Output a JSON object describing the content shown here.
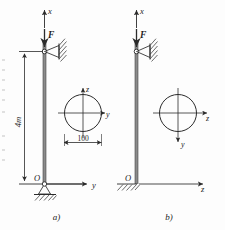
{
  "figure": {
    "title_present": false,
    "panels": [
      {
        "id": "a",
        "caption": "a)",
        "axis_vertical_label": "x",
        "force_label": "F",
        "length_label": "4m",
        "origin_label": "O",
        "axis_horizontal_label": "y",
        "top_support": "pin-support-hatched",
        "bottom_support": "pinned-hinge-ground",
        "section": {
          "shape": "circle",
          "axis_up_label": "z",
          "axis_right_label": "y",
          "dimension_label": "100"
        }
      },
      {
        "id": "b",
        "caption": "b)",
        "axis_vertical_label": "x",
        "force_label": "F",
        "origin_label": "O",
        "axis_horizontal_label": "z",
        "top_support": "pin-support-hatched",
        "bottom_support": "fixed-ground-hatched",
        "section": {
          "shape": "circle",
          "axis_right_label": "z",
          "axis_down_label": "y"
        }
      }
    ]
  },
  "colors": {
    "stroke": "#2b2b2b",
    "column": "#6f6f6f",
    "background": "#fdfdfd",
    "text": "#232323"
  }
}
